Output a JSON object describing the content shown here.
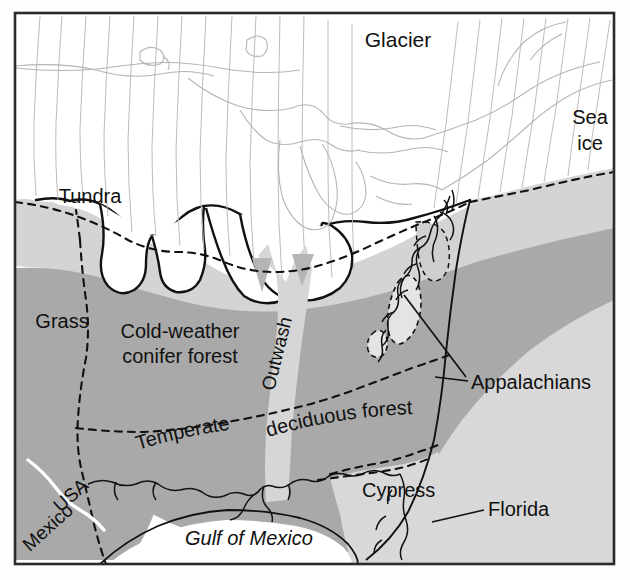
{
  "map": {
    "title": "Ice Age North America Vegetation Map",
    "frame": {
      "x": 14,
      "y": 12,
      "width": 601,
      "height": 553
    },
    "colors": {
      "ice_white": "#ffffff",
      "page_background": "#fdfdfd",
      "light_gray": "#d4d4d4",
      "shelf_gray": "#d8d8d8",
      "medium_gray": "#a9a9a9",
      "dark_outline": "#111111",
      "flowline_gray": "#b9b9b9",
      "border_white": "#ffffff",
      "label_text": "#111111"
    },
    "labels": [
      {
        "id": "glacier",
        "text": "Glacier",
        "x": 398,
        "y": 47,
        "size": 21,
        "style": "normal",
        "rotation": 0,
        "anchor": "middle"
      },
      {
        "id": "sea-ice-line1",
        "text": "Sea",
        "x": 590,
        "y": 124,
        "size": 20,
        "style": "normal",
        "rotation": 0,
        "anchor": "middle"
      },
      {
        "id": "sea-ice-line2",
        "text": "ice",
        "x": 590,
        "y": 150,
        "size": 20,
        "style": "normal",
        "rotation": 0,
        "anchor": "middle"
      },
      {
        "id": "tundra",
        "text": "Tundra",
        "x": 90,
        "y": 203,
        "size": 20,
        "style": "normal",
        "rotation": 0,
        "anchor": "middle"
      },
      {
        "id": "grass",
        "text": "Grass",
        "x": 62,
        "y": 328,
        "size": 20,
        "style": "normal",
        "rotation": 0,
        "anchor": "middle"
      },
      {
        "id": "conifer-line1",
        "text": "Cold-weather",
        "x": 180,
        "y": 338,
        "size": 20,
        "style": "normal",
        "rotation": 0,
        "anchor": "middle"
      },
      {
        "id": "conifer-line2",
        "text": "conifer forest",
        "x": 180,
        "y": 363,
        "size": 20,
        "style": "normal",
        "rotation": 0,
        "anchor": "middle"
      },
      {
        "id": "outwash",
        "text": "Outwash",
        "x": 283,
        "y": 355,
        "size": 19,
        "style": "normal",
        "rotation": -76,
        "anchor": "middle"
      },
      {
        "id": "appalachians",
        "text": "Appalachians",
        "x": 471,
        "y": 389,
        "size": 20,
        "style": "normal",
        "rotation": 0,
        "anchor": "start"
      },
      {
        "id": "cypress",
        "text": "Cypress",
        "x": 362,
        "y": 497,
        "size": 20,
        "style": "normal",
        "rotation": 0,
        "anchor": "start"
      },
      {
        "id": "florida",
        "text": "Florida",
        "x": 488,
        "y": 516,
        "size": 20,
        "style": "normal",
        "rotation": 0,
        "anchor": "start"
      },
      {
        "id": "gulf-of-mexico",
        "text": "Gulf of Mexico",
        "x": 185,
        "y": 545,
        "size": 20,
        "style": "italic",
        "rotation": 0,
        "anchor": "start"
      },
      {
        "id": "usa",
        "text": "USA",
        "x": 75,
        "y": 500,
        "size": 19,
        "style": "normal",
        "rotation": -42,
        "anchor": "middle"
      },
      {
        "id": "mexico",
        "text": "Mexico",
        "x": 52,
        "y": 532,
        "size": 19,
        "style": "normal",
        "rotation": -42,
        "anchor": "middle"
      }
    ],
    "curved_labels": [
      {
        "id": "temperate",
        "text": "Temperate",
        "size": 20,
        "path": "M 138 450 Q 190 434 245 428"
      },
      {
        "id": "deciduous-forest",
        "text": "deciduous forest",
        "size": 20,
        "path": "M 268 437 Q 340 416 418 414"
      }
    ],
    "leader_lines": [
      {
        "id": "appalachians-leader-upper",
        "x1": 404,
        "y1": 295,
        "x2": 466,
        "y2": 377
      },
      {
        "id": "appalachians-leader-lower",
        "x1": 435,
        "y1": 377,
        "x2": 466,
        "y2": 381
      },
      {
        "id": "florida-leader",
        "x1": 432,
        "y1": 522,
        "x2": 484,
        "y2": 510
      }
    ],
    "regions": [
      {
        "id": "glacier-sheet",
        "label": "Glacier",
        "fill": "ice_white"
      },
      {
        "id": "sea-ice",
        "label": "Sea ice",
        "fill": "ice_white"
      },
      {
        "id": "tundra-zone",
        "label": "Tundra",
        "fill": "light_gray"
      },
      {
        "id": "grass-zone",
        "label": "Grass",
        "fill": "medium_gray"
      },
      {
        "id": "conifer-zone",
        "label": "Cold-weather conifer forest",
        "fill": "medium_gray"
      },
      {
        "id": "outwash-channel",
        "label": "Outwash",
        "fill": "light_gray"
      },
      {
        "id": "deciduous-zone",
        "label": "Temperate deciduous forest",
        "fill": "medium_gray"
      },
      {
        "id": "cypress-zone",
        "label": "Cypress",
        "fill": "shelf_gray"
      },
      {
        "id": "gulf-of-mexico-water",
        "label": "Gulf of Mexico",
        "fill": "ice_white"
      },
      {
        "id": "appalachian-highlands",
        "label": "Appalachians",
        "fill": "shelf_gray"
      }
    ]
  }
}
